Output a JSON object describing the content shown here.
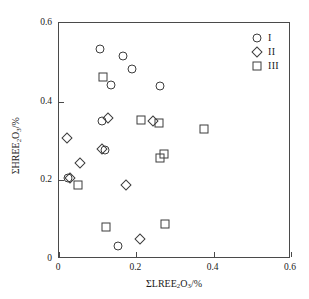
{
  "chart_data": {
    "type": "scatter",
    "title": "",
    "xlabel": "ΣLREE₂O₃/%",
    "ylabel": "ΣHREE₂O₃/%",
    "xlim": [
      0,
      0.6
    ],
    "ylim": [
      0,
      0.6
    ],
    "xticks": [
      0,
      0.2,
      0.4,
      0.6
    ],
    "yticks": [
      0,
      0.2,
      0.4,
      0.6
    ],
    "xticklabels": [
      "0",
      "0.2",
      "0.4",
      "0.6"
    ],
    "yticklabels": [
      "0",
      "0.2",
      "0.4",
      "0.6"
    ],
    "grid": false,
    "legend_position": "top-right",
    "series": [
      {
        "name": "I",
        "marker": "circle",
        "points": [
          [
            0.105,
            0.535
          ],
          [
            0.165,
            0.517
          ],
          [
            0.188,
            0.483
          ],
          [
            0.135,
            0.442
          ],
          [
            0.26,
            0.44
          ],
          [
            0.112,
            0.35
          ],
          [
            0.118,
            0.278
          ],
          [
            0.022,
            0.205
          ],
          [
            0.152,
            0.032
          ]
        ]
      },
      {
        "name": "II",
        "marker": "diamond",
        "points": [
          [
            0.128,
            0.358
          ],
          [
            0.02,
            0.308
          ],
          [
            0.243,
            0.352
          ],
          [
            0.11,
            0.28
          ],
          [
            0.055,
            0.245
          ],
          [
            0.028,
            0.205
          ],
          [
            0.172,
            0.188
          ],
          [
            0.21,
            0.052
          ]
        ]
      },
      {
        "name": "III",
        "marker": "square",
        "points": [
          [
            0.115,
            0.462
          ],
          [
            0.212,
            0.353
          ],
          [
            0.258,
            0.347
          ],
          [
            0.375,
            0.33
          ],
          [
            0.272,
            0.268
          ],
          [
            0.262,
            0.258
          ],
          [
            0.05,
            0.188
          ],
          [
            0.275,
            0.09
          ],
          [
            0.122,
            0.082
          ]
        ]
      }
    ]
  },
  "legend": {
    "entries": [
      {
        "label": "I",
        "marker": "circle"
      },
      {
        "label": "II",
        "marker": "diamond"
      },
      {
        "label": "III",
        "marker": "square"
      }
    ]
  }
}
